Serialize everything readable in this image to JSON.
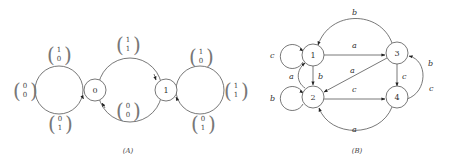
{
  "diagram_a": {
    "caption": "(A)",
    "nodes": [
      {
        "id": "0",
        "label": "0"
      },
      {
        "id": "1",
        "label": "1"
      }
    ],
    "vectors": {
      "left_top": {
        "top": "1",
        "bottom": "0"
      },
      "left_left": {
        "top": "0",
        "bottom": "0"
      },
      "left_bottom": {
        "top": "0",
        "bottom": "1"
      },
      "mid_top": {
        "top": "1",
        "bottom": "1"
      },
      "mid_bottom": {
        "top": "0",
        "bottom": "0"
      },
      "right_top": {
        "top": "1",
        "bottom": "0"
      },
      "right_bottom": {
        "top": "0",
        "bottom": "1"
      },
      "right_right": {
        "top": "1",
        "bottom": "1"
      }
    }
  },
  "diagram_b": {
    "caption": "(B)",
    "nodes": [
      {
        "id": "1",
        "label": "1"
      },
      {
        "id": "2",
        "label": "2"
      },
      {
        "id": "3",
        "label": "3"
      },
      {
        "id": "4",
        "label": "4"
      }
    ],
    "edge_labels": {
      "loop_1": "c",
      "loop_2": "b",
      "e_1_3": "a",
      "e_1_2": "b",
      "e_2_1": "a",
      "e_3_2": "a",
      "e_2_4": "c",
      "e_3_4": "c",
      "e_3_1": "b",
      "e_4_3_b": "b",
      "e_4_3_c": "c",
      "e_4_2": "a"
    }
  }
}
